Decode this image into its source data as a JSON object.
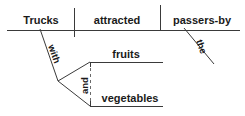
{
  "diagram": {
    "type": "reed-kellogg-sentence-diagram",
    "sentence": "Trucks attracted passers-by with fruits and vegetables the",
    "baseline": {
      "subject": "Trucks",
      "verb": "attracted",
      "direct_object": "passers-by"
    },
    "modifiers": {
      "prepositional_marker": "with",
      "article": "the",
      "conjunction": "and"
    },
    "compound_object_of_preposition": {
      "first": "fruits",
      "second": "vegetables"
    }
  },
  "labels": {
    "subject": "Trucks",
    "verb": "attracted",
    "object": "passers-by",
    "preposition": "with",
    "article": "the",
    "conjunction": "and",
    "prep_object_1": "fruits",
    "prep_object_2": "vegetables"
  },
  "colors": {
    "background": "#ffffff",
    "line": "#3a3a3a",
    "dashed_line": "#6a6a6a",
    "text": "#1a1a1a"
  }
}
